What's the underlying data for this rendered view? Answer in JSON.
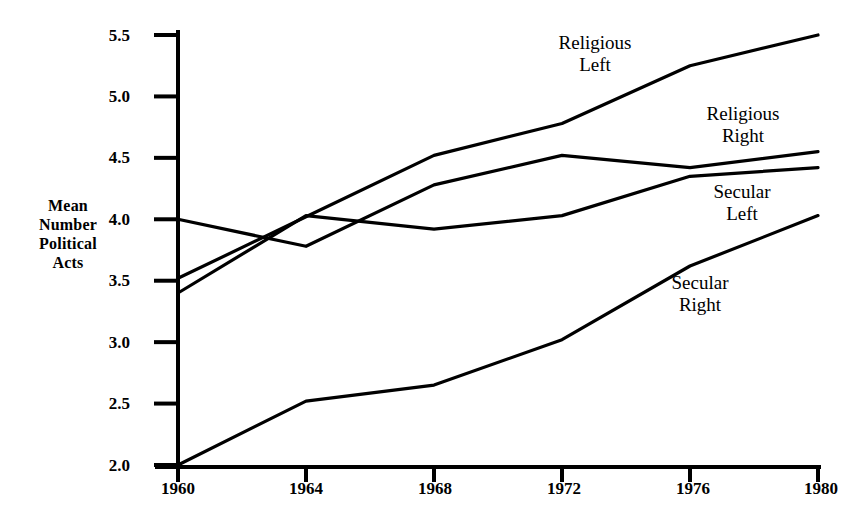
{
  "chart_data": {
    "type": "line",
    "title": "",
    "subtitle": "",
    "xlabel": "",
    "ylabel": "Mean Number Political Acts",
    "ylabel_lines": [
      "Mean",
      "Number",
      "Political",
      "Acts"
    ],
    "x": [
      1960,
      1964,
      1968,
      1972,
      1976,
      1980
    ],
    "xtick_labels": [
      "1960",
      "1964",
      "1968",
      "1972",
      "1976",
      "1980"
    ],
    "ytick_labels": [
      "5.5",
      "5.0",
      "4.5",
      "4.0",
      "3.5",
      "3.0",
      "2.5",
      "2.0"
    ],
    "yticks": [
      5.5,
      5.0,
      4.5,
      4.0,
      3.5,
      3.0,
      2.5,
      2.0
    ],
    "ylim": [
      2.0,
      5.5
    ],
    "xlim": [
      1960,
      1980
    ],
    "grid": false,
    "legend_position": "inline-annotations",
    "series": [
      {
        "name": "Religious Left",
        "label_lines": [
          "Religious",
          "Left"
        ],
        "values": [
          3.52,
          4.02,
          4.52,
          4.78,
          5.25,
          5.5
        ]
      },
      {
        "name": "Religious Right",
        "label_lines": [
          "Religious",
          "Right"
        ],
        "values": [
          4.0,
          3.78,
          4.28,
          4.52,
          4.42,
          4.55
        ]
      },
      {
        "name": "Secular Left",
        "label_lines": [
          "Secular",
          "Left"
        ],
        "values": [
          3.4,
          4.03,
          3.92,
          4.03,
          4.35,
          4.42
        ]
      },
      {
        "name": "Secular Right",
        "label_lines": [
          "Secular",
          "Right"
        ],
        "values": [
          2.0,
          2.52,
          2.65,
          3.02,
          3.62,
          4.03
        ]
      }
    ],
    "annotations": [
      {
        "text": "Religious Left",
        "series": "Religious Left"
      },
      {
        "text": "Religious Right",
        "series": "Religious Right"
      },
      {
        "text": "Secular Left",
        "series": "Secular Left"
      },
      {
        "text": "Secular Right",
        "series": "Secular Right"
      }
    ],
    "colors": {
      "line": "#000000",
      "axis": "#000000",
      "background": "#ffffff",
      "text": "#000000"
    }
  }
}
